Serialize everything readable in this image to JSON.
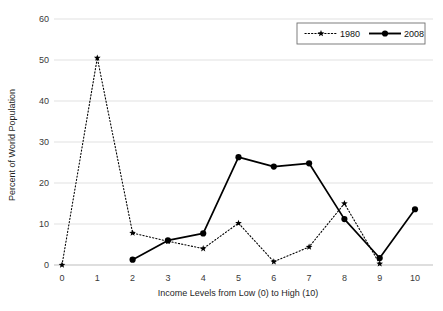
{
  "chart_data": {
    "type": "line",
    "title": "",
    "xlabel": "Income Levels from Low (0) to High (10)",
    "ylabel": "Percent of World Population",
    "x": [
      0,
      1,
      2,
      3,
      4,
      5,
      6,
      7,
      8,
      9,
      10
    ],
    "xticklabels": [
      "0",
      "1",
      "2",
      "3",
      "4",
      "5",
      "6",
      "7",
      "8",
      "9",
      "10"
    ],
    "yticklabels": [
      "0",
      "10",
      "20",
      "30",
      "40",
      "50",
      "60"
    ],
    "yticks": [
      0,
      10,
      20,
      30,
      40,
      50,
      60
    ],
    "xlim": [
      0,
      10
    ],
    "ylim": [
      0,
      60
    ],
    "grid": "horizontal",
    "legend_position": "top-right",
    "series": [
      {
        "name": "1980",
        "style": "dotted",
        "marker": "star",
        "color": "#000000",
        "x": [
          0,
          1,
          2,
          3,
          4,
          5,
          6,
          7,
          8,
          9
        ],
        "values": [
          0.0,
          50.5,
          7.8,
          5.8,
          4.0,
          10.2,
          0.8,
          4.4,
          15.0,
          0.3
        ]
      },
      {
        "name": "2008",
        "style": "solid",
        "marker": "circle",
        "color": "#000000",
        "x": [
          2,
          3,
          4,
          5,
          6,
          7,
          8,
          9,
          10
        ],
        "values": [
          1.3,
          6.0,
          7.7,
          26.3,
          24.0,
          24.8,
          11.2,
          1.7,
          13.6
        ]
      }
    ]
  },
  "legend": {
    "items": [
      {
        "label": "1980"
      },
      {
        "label": "2008"
      }
    ]
  }
}
